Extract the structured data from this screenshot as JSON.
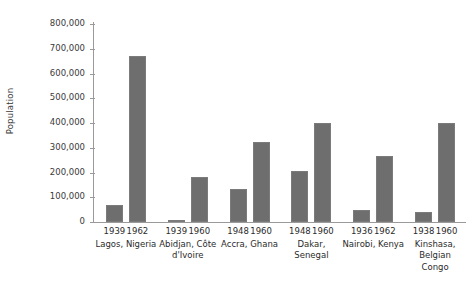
{
  "chart_data": {
    "type": "bar",
    "title": "",
    "xlabel": "",
    "ylabel": "Population",
    "ylim": [
      0,
      800000
    ],
    "ytick_labels": [
      "800,000",
      "700,000",
      "600,000",
      "500,000",
      "400,000",
      "300,000",
      "200,000",
      "100,000",
      "0"
    ],
    "ytick_values": [
      800000,
      700000,
      600000,
      500000,
      400000,
      300000,
      200000,
      100000,
      0
    ],
    "grid": false,
    "legend": "none",
    "bar_color": "#6e6e6e",
    "axis_color": "#9a9a9a",
    "groups": [
      {
        "place": "Lagos, Nigeria",
        "bars": [
          {
            "year": "1939",
            "value": 70000
          },
          {
            "year": "1962",
            "value": 670000
          }
        ]
      },
      {
        "place": "Abidjan, Côte\nd'Ivoire",
        "bars": [
          {
            "year": "1939",
            "value": 10000
          },
          {
            "year": "1960",
            "value": 180000
          }
        ]
      },
      {
        "place": "Accra, Ghana",
        "bars": [
          {
            "year": "1948",
            "value": 135000
          },
          {
            "year": "1960",
            "value": 325000
          }
        ]
      },
      {
        "place": "Dakar, Senegal",
        "bars": [
          {
            "year": "1948",
            "value": 205000
          },
          {
            "year": "1960",
            "value": 400000
          }
        ]
      },
      {
        "place": "Nairobi, Kenya",
        "bars": [
          {
            "year": "1936",
            "value": 50000
          },
          {
            "year": "1962",
            "value": 265000
          }
        ]
      },
      {
        "place": "Kinshasa,\nBelgian\nCongo",
        "bars": [
          {
            "year": "1938",
            "value": 40000
          },
          {
            "year": "1960",
            "value": 400000
          }
        ]
      }
    ]
  }
}
